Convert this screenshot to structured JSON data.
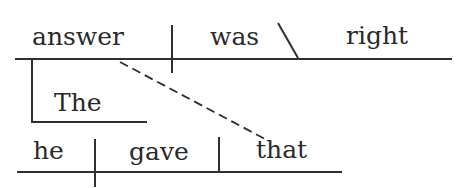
{
  "diagram": {
    "type": "Reed-Kellogg sentence diagram",
    "sentence": "The answer that he gave was right",
    "main_clause": {
      "subject": "answer",
      "verb": "was",
      "predicate_adjective": "right",
      "modifiers": {
        "subject_article": "The"
      }
    },
    "relative_clause": {
      "subject": "he",
      "verb": "gave",
      "direct_object": "that",
      "connects_to": "answer"
    }
  }
}
